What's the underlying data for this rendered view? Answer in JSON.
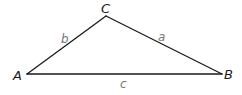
{
  "diagram": {
    "type": "triangle",
    "vertices": {
      "A": {
        "label": "A",
        "x": 27,
        "y": 74
      },
      "B": {
        "label": "B",
        "x": 222,
        "y": 74
      },
      "C": {
        "label": "C",
        "x": 106,
        "y": 16
      }
    },
    "sides": {
      "a": {
        "label": "a",
        "from": "C",
        "to": "B"
      },
      "b": {
        "label": "b",
        "from": "A",
        "to": "C"
      },
      "c": {
        "label": "c",
        "from": "A",
        "to": "B"
      }
    },
    "colors": {
      "line": "#1a1a1a",
      "vertex_label": "#1a1a1a",
      "side_label": "#777777"
    }
  }
}
